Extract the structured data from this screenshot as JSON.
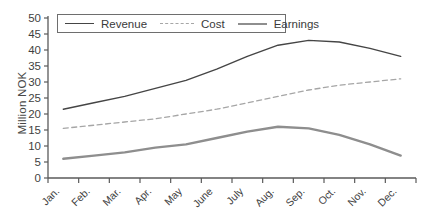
{
  "chart_data": {
    "type": "line",
    "title": "",
    "xlabel": "",
    "ylabel": "Million NOK",
    "ylim": [
      0,
      50
    ],
    "y_tick_step": 5,
    "grid": false,
    "legend_position": "top-inside-bordered-box",
    "categories": [
      "Jan.",
      "Feb.",
      "Mar.",
      "Apr.",
      "May",
      "June",
      "July",
      "Aug.",
      "Sep.",
      "Oct.",
      "Nov.",
      "Dec."
    ],
    "series": [
      {
        "name": "Revenue",
        "values": [
          21.5,
          23.5,
          25.5,
          28,
          30.5,
          34,
          38,
          41.5,
          43,
          42.5,
          40.5,
          38
        ],
        "color": "#454545",
        "line_style": "solid",
        "line_width": 1.4
      },
      {
        "name": "Cost",
        "values": [
          15.5,
          16.5,
          17.5,
          18.5,
          20,
          21.5,
          23.5,
          25.5,
          27.5,
          29,
          30,
          31
        ],
        "color": "#a6a6a6",
        "line_style": "dashed",
        "line_width": 1.3
      },
      {
        "name": "Earnings",
        "values": [
          6,
          7,
          8,
          9.5,
          10.5,
          12.5,
          14.5,
          16,
          15.5,
          13.5,
          10.5,
          7
        ],
        "color": "#8e8e8e",
        "line_style": "solid",
        "line_width": 2.4
      }
    ],
    "axis_color": "#5a5a5a",
    "tick_label_color": "#3f3f3f"
  }
}
